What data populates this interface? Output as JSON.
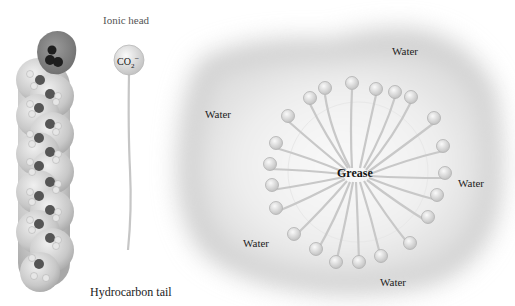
{
  "labels": {
    "ionic_head": "Ionic head",
    "hydrocarbon_tail": "Hydrocarbon tail",
    "co2": "CO",
    "co2_sub": "2",
    "co2_sup": "−",
    "grease": "Grease",
    "water": [
      "Water",
      "Water",
      "Water",
      "Water",
      "Water"
    ]
  },
  "colors": {
    "background": "#ffffff",
    "water_cloud": "#d8d8d8",
    "sphere": "#dcdcdc",
    "tail": "#c8c8c8",
    "text": "#222222"
  }
}
